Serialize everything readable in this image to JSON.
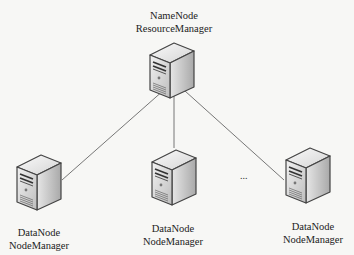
{
  "diagram": {
    "type": "hadoop-cluster-topology",
    "master": {
      "line1": "NameNode",
      "line2": "ResourceManager",
      "icon": "server-tower-icon"
    },
    "workers": [
      {
        "line1": "DataNode",
        "line2": "NodeManager",
        "icon": "server-tower-icon"
      },
      {
        "line1": "DataNode",
        "line2": "NodeManager",
        "icon": "server-tower-icon"
      },
      {
        "line1": "DataNode",
        "line2": "NodeManager",
        "icon": "server-tower-icon"
      }
    ],
    "ellipsis": "...",
    "edges": [
      {
        "from": "master",
        "to": "workers.0"
      },
      {
        "from": "master",
        "to": "workers.1"
      },
      {
        "from": "master",
        "to": "workers.2"
      }
    ]
  }
}
